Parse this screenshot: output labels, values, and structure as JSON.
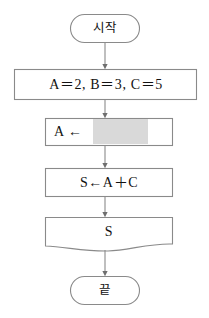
{
  "diagram": {
    "background_color": "#ffffff",
    "stroke_color": "#808080",
    "text_color": "#111111",
    "redaction_color": "#d9d9d9"
  },
  "nodes": {
    "start": {
      "label": "시작",
      "shape": "terminal-pill"
    },
    "init": {
      "label": "A＝2, B＝3, C＝5",
      "shape": "process-rectangle"
    },
    "assign_a": {
      "label": "A ←",
      "shape": "process-rectangle",
      "redacted_value": ""
    },
    "sum": {
      "label": "S←A＋C",
      "shape": "process-rectangle"
    },
    "output": {
      "label": "S",
      "shape": "document-wave"
    },
    "end": {
      "label": "끝",
      "shape": "terminal-pill"
    }
  },
  "connectors": [
    {
      "from": "start",
      "to": "init",
      "type": "arrow-down"
    },
    {
      "from": "init",
      "to": "assign_a",
      "type": "arrow-down"
    },
    {
      "from": "assign_a",
      "to": "sum",
      "type": "arrow-down"
    },
    {
      "from": "sum",
      "to": "output",
      "type": "arrow-down"
    },
    {
      "from": "output",
      "to": "end",
      "type": "arrow-down"
    }
  ]
}
